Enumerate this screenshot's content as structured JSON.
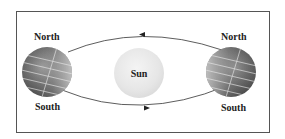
{
  "diagram": {
    "type": "orbit-seasons",
    "left_globe": {
      "top_label": "North",
      "bottom_label": "South"
    },
    "right_globe": {
      "top_label": "North",
      "bottom_label": "South"
    },
    "center": {
      "label": "Sun"
    },
    "orbit": {
      "top_arrow_direction": "left",
      "bottom_arrow_direction": "right"
    },
    "colors": {
      "border": "#555555",
      "text": "#222222",
      "orbit_line": "#333333",
      "sun_fill": "#e6e6e6",
      "globe_dark": "#4a4a4a",
      "globe_light": "#d8d8d8"
    }
  }
}
